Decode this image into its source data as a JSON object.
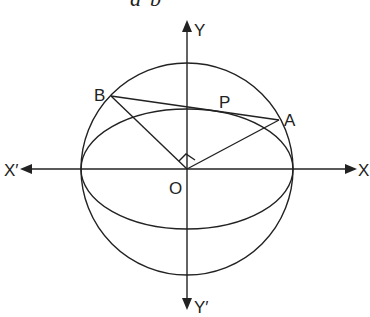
{
  "header_fragment": {
    "left": "a",
    "right": "b"
  },
  "labels": {
    "y_axis_pos": "Y",
    "y_axis_neg": "Y′",
    "x_axis_pos": "X",
    "x_axis_neg": "X′",
    "origin": "O",
    "point_a": "A",
    "point_b": "B",
    "point_p": "P"
  },
  "geometry": {
    "origin": [
      187,
      169
    ],
    "circle_radius": 106,
    "ellipse_rx": 106,
    "ellipse_ry": 60,
    "point_a": [
      279,
      120
    ],
    "point_b": [
      111,
      96
    ],
    "right_angle_at_origin": true
  },
  "colors": {
    "stroke": "#222222",
    "background": "#ffffff"
  }
}
